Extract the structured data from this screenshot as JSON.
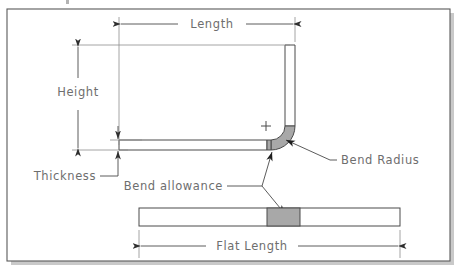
{
  "figure": {
    "kind": "engineering-drawing",
    "background_color": "#ffffff",
    "frame_color": "#5a5a5a",
    "shadow_color": "#c9c9c9",
    "line_color": "#4a4a4a",
    "text_color": "#6e6e6e",
    "fill_white": "#ffffff",
    "fill_gray": "#a8a8a8"
  },
  "labels": {
    "length": "Length",
    "height": "Height",
    "thickness": "Thickness",
    "bend_radius": "Bend Radius",
    "bend_allowance": "Bend allowance",
    "flat_length": "Flat Length"
  },
  "annotations": {
    "center_mark": "+"
  },
  "dimensions": {
    "length": {
      "label": "Length",
      "orientation": "horizontal",
      "y": 24,
      "x_start": 119,
      "x_end": 295,
      "arrows": "both"
    },
    "height": {
      "label": "Height",
      "orientation": "vertical",
      "x": 78,
      "y_start": 45,
      "y_end": 150,
      "arrows": "both"
    },
    "thickness": {
      "label": "Thickness",
      "orientation": "vertical",
      "x": 118,
      "y_start": 133,
      "y_end": 163,
      "arrows": "both"
    },
    "flat_length": {
      "label": "Flat Length",
      "orientation": "horizontal",
      "y": 246,
      "x_start": 139,
      "x_end": 400,
      "arrows": "both"
    }
  },
  "geometry": {
    "bent_part": {
      "thickness": 10,
      "bend_radius": 14,
      "vertical_leg": {
        "x_inner": 285,
        "x_outer": 295,
        "y_top": 45
      },
      "horizontal_leg": {
        "y_top": 140,
        "y_bottom": 150,
        "x_left": 119
      }
    },
    "flat_part": {
      "x_left": 139,
      "x_right": 400,
      "y_top": 208,
      "y_bottom": 226,
      "bend_region": {
        "x_left": 267,
        "x_right": 300
      }
    }
  },
  "leaders": {
    "bend_radius": {
      "from": [
        397,
        160
      ],
      "to": [
        300,
        140
      ]
    },
    "bend_allowance_up": {
      "from": [
        243,
        186
      ],
      "to": [
        272,
        152
      ]
    },
    "bend_allowance_down": {
      "from": [
        243,
        186
      ],
      "to": [
        280,
        212
      ]
    }
  }
}
